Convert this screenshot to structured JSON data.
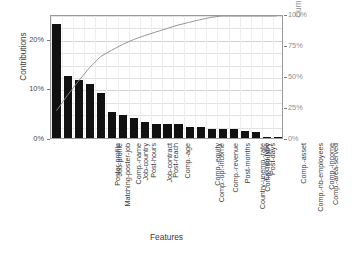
{
  "chart_data": {
    "type": "bar",
    "title": "",
    "subtitle": "",
    "xlabel": "Features",
    "ylabel": "Contributions",
    "y2label": "Cumulative contributions",
    "grid": true,
    "legend": null,
    "ylim": [
      0,
      25
    ],
    "y2lim": [
      0,
      100
    ],
    "yticks": [
      "0%",
      "10%",
      "20%"
    ],
    "ytick_values": [
      0,
      10,
      20
    ],
    "y2ticks": [
      "0%",
      "25%",
      "50%",
      "75%",
      "100%"
    ],
    "y2tick_values": [
      0,
      25,
      50,
      75,
      100
    ],
    "categories": [
      "Matching-poster-job",
      "Poster-profile",
      "Job-profile",
      "Comp.-name",
      "Job-country",
      "Post-hours",
      "Job-contract",
      "Post-reach",
      "Comp.-age",
      "Comp.-op.-income",
      "Comp.-equity",
      "Comp.-revenue",
      "Country-unemp.-rate",
      "Post-months",
      "Comp.-industry",
      "Comp.-type",
      "Post-days",
      "Comp.-nb-employees",
      "Comp.-asset",
      "Comp.-area-served",
      "Comp.-income"
    ],
    "series": [
      {
        "name": "Contributions",
        "axis": "left",
        "render": "bar",
        "color": "#111111",
        "values": [
          23.0,
          12.5,
          11.6,
          10.8,
          9.0,
          5.2,
          4.7,
          4.0,
          3.2,
          2.9,
          2.8,
          2.8,
          2.2,
          2.2,
          1.9,
          1.8,
          1.8,
          1.4,
          1.2,
          0.3,
          0.25
        ]
      },
      {
        "name": "Cumulative contributions",
        "axis": "right",
        "render": "line",
        "color": "#8a8a8a",
        "values": [
          23.0,
          35.5,
          47.1,
          57.9,
          66.9,
          72.1,
          76.8,
          80.8,
          84.0,
          86.9,
          89.7,
          92.5,
          94.7,
          96.9,
          98.8,
          100.6,
          102.4,
          103.8,
          105.0,
          105.3,
          105.55
        ]
      }
    ]
  },
  "axes": {
    "left_title": "Contributions",
    "right_title": "Cumulative contributions",
    "bottom_title": "Features"
  },
  "colors": {
    "bar": "#111111",
    "curve": "#8a8a8a",
    "frame": "#9a9a9a",
    "grid": "#e2e2e2",
    "text": "#3b3b3b",
    "right_axis_text": "#8f8f8f",
    "background": "#ffffff"
  }
}
